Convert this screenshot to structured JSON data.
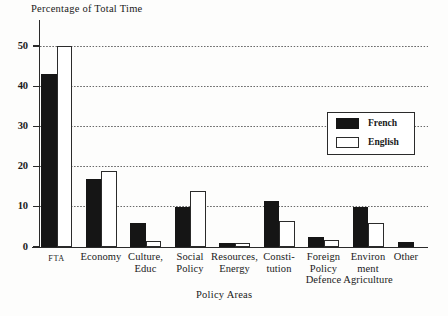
{
  "chart_data": {
    "type": "bar",
    "title": "",
    "ylabel": "Percentage of Total Time",
    "xlabel": "Policy Areas",
    "ylim": [
      0,
      50
    ],
    "yticks": [
      0,
      10,
      20,
      30,
      40,
      50
    ],
    "grid": true,
    "legend_position": "inside-right",
    "categories": [
      "FTA",
      "Economy",
      "Culture, Educ",
      "Social Policy",
      "Resources, Energy",
      "Constitution",
      "Foreign Policy Defence",
      "Environment Agriculture",
      "Other"
    ],
    "category_lines": [
      [
        "FTA"
      ],
      [
        "Economy"
      ],
      [
        "Culture,",
        "Educ"
      ],
      [
        "Social",
        "Policy"
      ],
      [
        "Resources,",
        "Energy"
      ],
      [
        "Consti-",
        "tution"
      ],
      [
        "Foreign",
        "Policy",
        "Defence"
      ],
      [
        "Environ",
        "ment",
        "Agriculture"
      ],
      [
        "Other"
      ]
    ],
    "series": [
      {
        "name": "French",
        "color": "#151515",
        "values": [
          43,
          17,
          6,
          10,
          1,
          11.5,
          2.5,
          10,
          1.3
        ]
      },
      {
        "name": "English",
        "color": "#ffffff",
        "values": [
          50,
          19,
          1.5,
          14,
          1,
          6.5,
          1.8,
          6,
          null
        ]
      }
    ]
  },
  "legend": {
    "entries": [
      {
        "label": "French"
      },
      {
        "label": "English"
      }
    ]
  },
  "colors": {
    "french": "#151515",
    "english": "#ffffff",
    "axis": "#2a2a2a",
    "grid": "#6a6a6a",
    "background": "#fdfdfc"
  }
}
